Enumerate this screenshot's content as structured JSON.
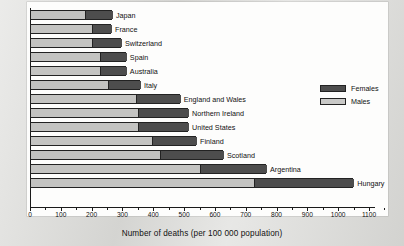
{
  "figure": {
    "background_color": "#fdfdfc",
    "page_color": "#d9d9d6",
    "x_axis_title": "Number of deaths (per 100 000 population)"
  },
  "legend": {
    "position": "upper-right-inside",
    "items": [
      {
        "label": "Females",
        "color": "#4d4d4d",
        "key": "females"
      },
      {
        "label": "Males",
        "color": "#c9c9c7",
        "key": "males"
      }
    ]
  },
  "chart_data": {
    "type": "bar",
    "orientation": "horizontal",
    "stacked": true,
    "title": "",
    "subtitle": "",
    "xlabel": "Number of deaths (per 100 000 population)",
    "ylabel": "",
    "xlim": [
      0,
      1150
    ],
    "xticks": [
      0,
      100,
      200,
      300,
      400,
      500,
      600,
      700,
      800,
      900,
      1000,
      1100
    ],
    "xtick_labels": [
      "0",
      "100",
      "200",
      "300",
      "400",
      "500",
      "600",
      "700",
      "800",
      "900",
      "1000",
      "1100"
    ],
    "minor_tick_interval": 50,
    "grid": false,
    "legend_position": "upper right",
    "categories": [
      "Japan",
      "France",
      "Switzerland",
      "Spain",
      "Australia",
      "Italy",
      "England and Wales",
      "Northern Ireland",
      "United States",
      "Finland",
      "Scotland",
      "Argentina",
      "Hungary"
    ],
    "series": [
      {
        "name": "Males",
        "color": "#c3c3c1",
        "values": [
          178,
          201,
          201,
          227,
          227,
          253,
          344,
          350,
          350,
          396,
          422,
          552,
          727
        ]
      },
      {
        "name": "Females",
        "color": "#4d4d4d",
        "values": [
          88,
          62,
          94,
          84,
          84,
          104,
          142,
          163,
          163,
          143,
          204,
          214,
          322
        ]
      }
    ],
    "totals": [
      266,
      263,
      295,
      311,
      311,
      357,
      486,
      513,
      513,
      539,
      626,
      766,
      1049
    ]
  }
}
